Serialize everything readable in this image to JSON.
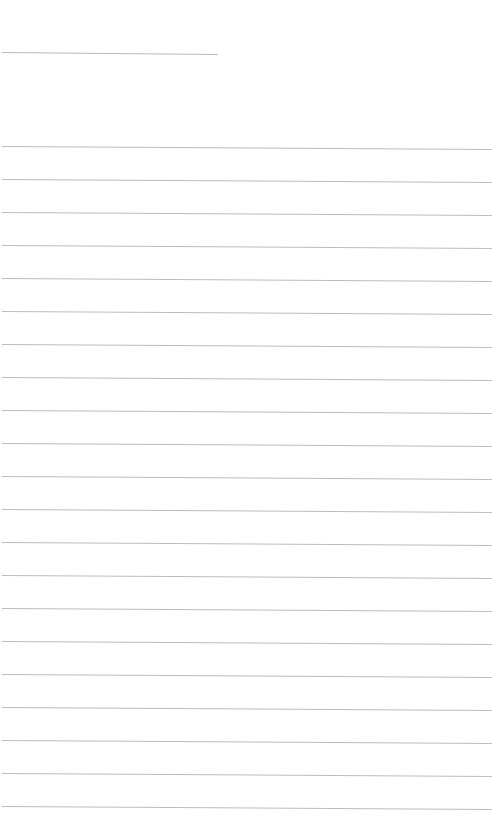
{
  "page": {
    "type": "blank lined paper",
    "line_color": "#bdbdbd",
    "background": "#ffffff",
    "short_line": {
      "top": 52,
      "left": 2,
      "width": 216
    },
    "ruled_lines": {
      "first_top": 146,
      "spacing": 33,
      "count": 21,
      "left": 2,
      "width": 490
    }
  }
}
